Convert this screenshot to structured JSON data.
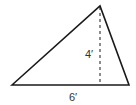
{
  "diagram": {
    "shape": "triangle",
    "labels": {
      "height": "4′",
      "base": "6′"
    },
    "colors": {
      "stroke": "#1a1a1a",
      "label": "#333333",
      "background": "#ffffff"
    }
  }
}
